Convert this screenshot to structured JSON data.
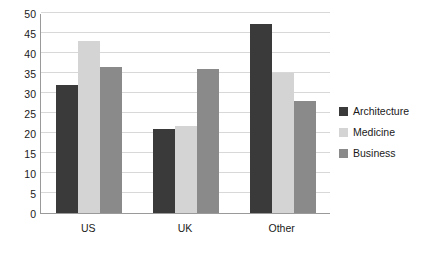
{
  "chart_data": {
    "type": "bar",
    "title": "",
    "subtitle": "",
    "xlabel": "",
    "ylabel": "",
    "categories": [
      "US",
      "UK",
      "Other"
    ],
    "series": [
      {
        "name": "Architecture",
        "color": "#3a3a3a",
        "values": [
          32,
          21,
          47.3
        ]
      },
      {
        "name": "Medicine",
        "color": "#d4d4d4",
        "values": [
          43,
          21.8,
          35
        ]
      },
      {
        "name": "Business",
        "color": "#8a8a8a",
        "values": [
          36.5,
          36,
          28
        ]
      }
    ],
    "ylim": [
      0,
      50
    ],
    "yticks": [
      0,
      5,
      10,
      15,
      20,
      25,
      30,
      35,
      40,
      45,
      50
    ],
    "ytick_labels": [
      "0",
      "5",
      "10",
      "15",
      "20",
      "25",
      "30",
      "35",
      "40",
      "45",
      "50"
    ],
    "grid": true,
    "grid_axis": "y",
    "grid_color": "#d8d8d8",
    "legend_position": "right",
    "axis_color": "#9a9a9a",
    "background": "#ffffff"
  }
}
